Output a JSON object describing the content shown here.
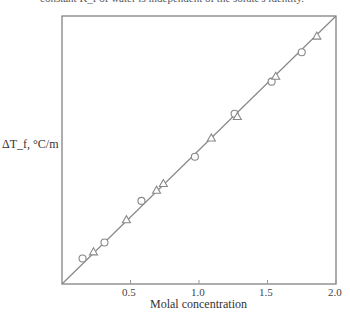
{
  "caption": "constant K_f of water is independent of the solute's identity.",
  "chart_data": {
    "type": "scatter",
    "title": "",
    "xlabel": "Molal concentration",
    "ylabel": "ΔT_f, °C/m",
    "xlim": [
      0,
      2.0
    ],
    "ylim": [
      0,
      2.0
    ],
    "xticks": [
      "0.5",
      "1.0",
      "1.5",
      "2.0"
    ],
    "grid": false,
    "legend": null,
    "fit_line": {
      "x": [
        0,
        2.0
      ],
      "y": [
        0,
        2.0
      ]
    },
    "series": [
      {
        "name": "circles",
        "marker": "circle",
        "x": [
          0.15,
          0.31,
          0.58,
          0.97,
          1.26,
          1.53,
          1.75
        ],
        "y": [
          0.19,
          0.31,
          0.62,
          0.95,
          1.27,
          1.51,
          1.73
        ]
      },
      {
        "name": "triangles",
        "marker": "triangle",
        "x": [
          0.23,
          0.47,
          0.69,
          0.74,
          1.09,
          1.28,
          1.56,
          1.86
        ],
        "y": [
          0.24,
          0.48,
          0.7,
          0.75,
          1.09,
          1.25,
          1.55,
          1.85
        ]
      }
    ]
  }
}
